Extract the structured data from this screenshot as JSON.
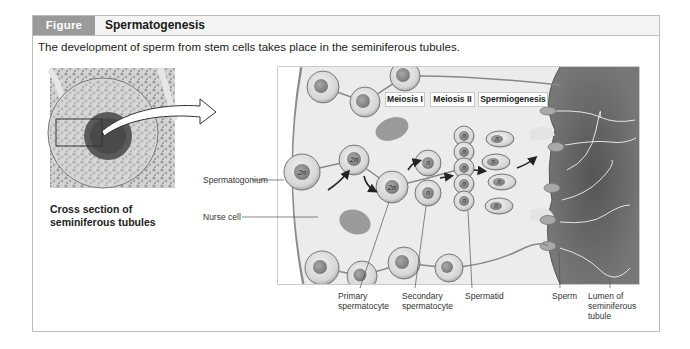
{
  "figure": {
    "tag": "Figure 33.9",
    "title": "Spermatogenesis",
    "caption": "The development of sperm from stem cells takes place in the seminiferous tubules."
  },
  "micrograph": {
    "caption_line1": "Cross section of",
    "caption_line2": "seminiferous tubules"
  },
  "stages": [
    {
      "label": "Meiosis I"
    },
    {
      "label": "Meiosis II"
    },
    {
      "label": "Spermiogenesis"
    }
  ],
  "side_labels": {
    "spermatogonium": "Spermatogonium",
    "nurse_cell": "Nurse cell"
  },
  "bottom_labels": {
    "primary_line1": "Primary",
    "primary_line2": "spermatocyte",
    "secondary_line1": "Secondary",
    "secondary_line2": "spermatocyte",
    "spermatid": "Spermatid",
    "sperm": "Sperm",
    "lumen_line1": "Lumen of",
    "lumen_line2": "seminiferous",
    "lumen_line3": "tubule"
  },
  "cell_ploidy": {
    "diploid": "2n",
    "haploid": "n"
  },
  "colors": {
    "header_tag_bg": "#9a9a9a",
    "frame_border": "#bdbdbd",
    "lumen": "#6e6e6e",
    "cytoplasm": "#f0f0f0"
  }
}
